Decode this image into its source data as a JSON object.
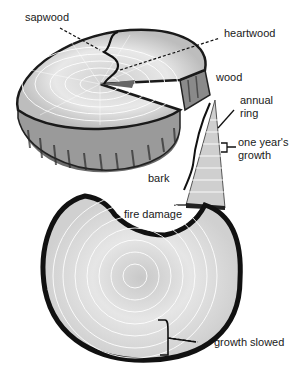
{
  "diagram": {
    "labels": {
      "sapwood": "sapwood",
      "heartwood": "heartwood",
      "wood": "wood",
      "annual_ring_1": "annual",
      "annual_ring_2": "ring",
      "one_years_growth_1": "one year's",
      "one_years_growth_2": "growth",
      "bark": "bark",
      "fire_damage": "fire damage",
      "growth_slowed": "growth slowed"
    }
  }
}
